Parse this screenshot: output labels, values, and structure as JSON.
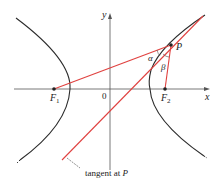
{
  "figure": {
    "colors": {
      "curve": "#2b2b2b",
      "axes": "#555555",
      "red": "#e0413f",
      "text": "#222222"
    },
    "labels": {
      "x_axis": "x",
      "y_axis": "y",
      "origin": "0",
      "focus1_main": "F",
      "focus1_sub": "1",
      "focus2_main": "F",
      "focus2_sub": "2",
      "point": "P",
      "alpha": "α",
      "beta": "β",
      "tangent": "tangent at ",
      "tangent_point": "P"
    },
    "points": {
      "F1": [
        54,
        89
      ],
      "F2": [
        165,
        89
      ],
      "P": [
        171,
        45
      ],
      "origin": [
        110,
        89
      ]
    }
  }
}
